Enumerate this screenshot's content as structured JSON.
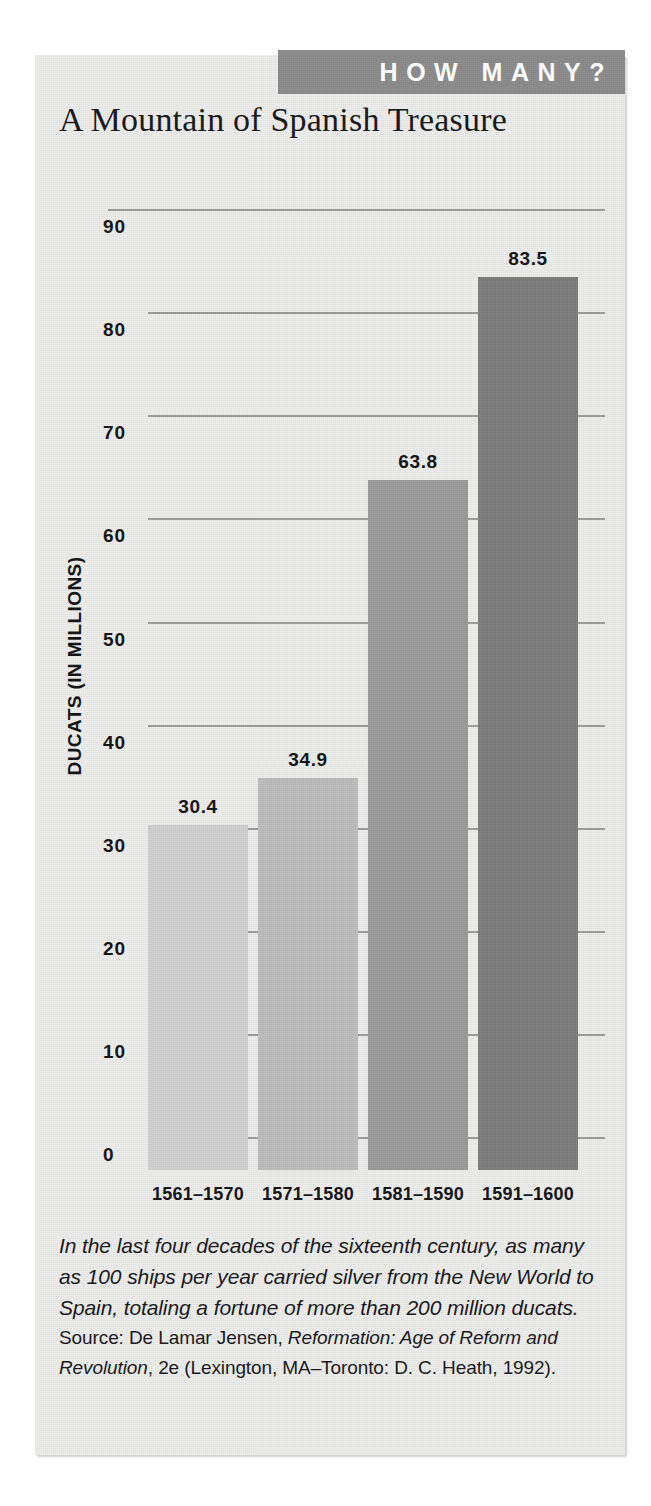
{
  "banner": {
    "label": "HOW MANY?"
  },
  "title": "A Mountain of Spanish Treasure",
  "colors": {
    "panel_background": "#ececea",
    "banner_background": "#8b8b8b",
    "banner_text": "#ffffff",
    "gridline": "#9b9b9b",
    "text": "#16161a",
    "bar_1": "#cfcfcf",
    "bar_2": "#bcbcbc",
    "bar_3": "#9a9a9a",
    "bar_4": "#7d7d7d"
  },
  "chart_data": {
    "type": "bar",
    "title": "A Mountain of Spanish Treasure",
    "xlabel": "",
    "ylabel": "DUCATS (IN MILLIONS)",
    "categories": [
      "1561–1570",
      "1571–1580",
      "1581–1590",
      "1591–1600"
    ],
    "values": [
      30.4,
      34.9,
      63.8,
      83.5
    ],
    "value_labels": [
      "30.4",
      "34.9",
      "63.8",
      "83.5"
    ],
    "bar_colors": [
      "#cfcfcf",
      "#bcbcbc",
      "#9a9a9a",
      "#7d7d7d"
    ],
    "ylim": [
      0,
      90
    ],
    "ytick_labels": [
      "0",
      "10",
      "20",
      "30",
      "40",
      "50",
      "60",
      "70",
      "80",
      "90"
    ],
    "ytick_values": [
      0,
      10,
      20,
      30,
      40,
      50,
      60,
      70,
      80,
      90
    ],
    "grid": true,
    "grid_axis": "y",
    "legend": false,
    "legend_position": "none"
  },
  "caption": {
    "body": "In the last four decades of the sixteenth century, as many as 100 ships per year carried silver from the New World to Spain, totaling a fortune of more than 200 million ducats.",
    "source_prefix": "Source: De Lamar Jensen, ",
    "source_work": "Reformation: Age of Reform and Revolution",
    "source_suffix": ", 2e (Lexington, MA–Toronto: D. C. Heath, 1992)."
  }
}
